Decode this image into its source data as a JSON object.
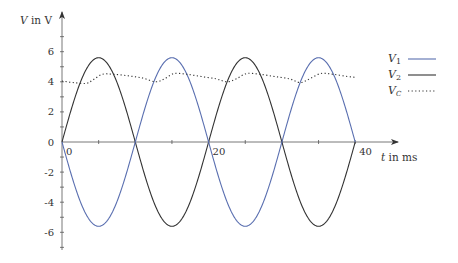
{
  "chart_data": {
    "type": "line",
    "title": "",
    "xlabel": "t in ms",
    "ylabel": "V in V",
    "xlim": [
      0,
      40
    ],
    "ylim": [
      -7,
      8
    ],
    "x_ticks": [
      0,
      20,
      40
    ],
    "x_minor_ticks": [
      5,
      10,
      15,
      25,
      30,
      35
    ],
    "y_ticks": [
      -6,
      -4,
      -2,
      0,
      2,
      4,
      6
    ],
    "y_minor_ticks": [
      -7,
      -5,
      -3,
      -1,
      1,
      3,
      5,
      7
    ],
    "grid": false,
    "legend_position": "upper right",
    "series": [
      {
        "name": "V_1",
        "label_main": "V",
        "label_sub": "1",
        "style": "solid",
        "color": "#5a6fb0",
        "formula": "-5.6*sin(2*pi*t/20)",
        "amplitude": 5.6,
        "period_ms": 20,
        "x": [
          0,
          2.5,
          5,
          7.5,
          10,
          12.5,
          15,
          17.5,
          20,
          22.5,
          25,
          27.5,
          30,
          32.5,
          35,
          37.5,
          40
        ],
        "values": [
          0,
          -3.96,
          -5.6,
          -3.96,
          0,
          3.96,
          5.6,
          3.96,
          0,
          -3.96,
          -5.6,
          -3.96,
          0,
          3.96,
          5.6,
          3.96,
          0
        ]
      },
      {
        "name": "V_2",
        "label_main": "V",
        "label_sub": "2",
        "style": "solid",
        "color": "#333333",
        "formula": "5.6*sin(2*pi*t/20)",
        "amplitude": 5.6,
        "period_ms": 20,
        "x": [
          0,
          2.5,
          5,
          7.5,
          10,
          12.5,
          15,
          17.5,
          20,
          22.5,
          25,
          27.5,
          30,
          32.5,
          35,
          37.5,
          40
        ],
        "values": [
          0,
          3.96,
          5.6,
          3.96,
          0,
          -3.96,
          -5.6,
          -3.96,
          0,
          3.96,
          5.6,
          3.96,
          0,
          -3.96,
          -5.6,
          -3.96,
          0
        ]
      },
      {
        "name": "V_C",
        "label_main": "V",
        "label_sub": "C",
        "style": "dotted",
        "color": "#333333",
        "x": [
          0,
          1.5,
          3.3,
          4.3,
          5.5,
          7,
          9,
          11,
          12.8,
          14,
          15.3,
          17,
          19,
          21,
          22.5,
          23.8,
          25.2,
          27,
          29,
          31,
          32.5,
          33.8,
          35.3,
          37,
          39,
          40
        ],
        "values": [
          4.05,
          3.95,
          3.9,
          4.15,
          4.5,
          4.5,
          4.4,
          4.25,
          4.0,
          4.2,
          4.55,
          4.5,
          4.35,
          4.2,
          4.0,
          4.2,
          4.55,
          4.5,
          4.35,
          4.2,
          3.95,
          4.2,
          4.55,
          4.5,
          4.35,
          4.3
        ]
      }
    ]
  },
  "legend": {
    "items": [
      {
        "main": "V",
        "sub": "1"
      },
      {
        "main": "V",
        "sub": "2"
      },
      {
        "main": "V",
        "sub": "C"
      }
    ]
  },
  "axes": {
    "x_label": "t in ms",
    "y_label_main": "V",
    "y_label_rest": " in V"
  }
}
